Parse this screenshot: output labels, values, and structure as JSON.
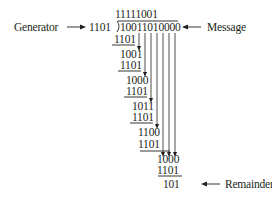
{
  "labels": {
    "generator": "Generator",
    "message": "Message",
    "remainder": "Remainder"
  },
  "division": {
    "quotient": "11111001",
    "divisor": "1101",
    "dividend": "10011010000",
    "steps": [
      {
        "subtrahend": "1101"
      },
      {
        "partial": "1001",
        "subtrahend": "1101"
      },
      {
        "partial": "1000",
        "subtrahend": "1101"
      },
      {
        "partial": "1011",
        "subtrahend": "1101"
      },
      {
        "partial": "1100",
        "subtrahend": "1101"
      },
      {
        "partial": "1000",
        "subtrahend": "1101"
      }
    ],
    "remainder": "101"
  },
  "colors": {
    "ink": "#231f20",
    "background": "#ffffff"
  }
}
